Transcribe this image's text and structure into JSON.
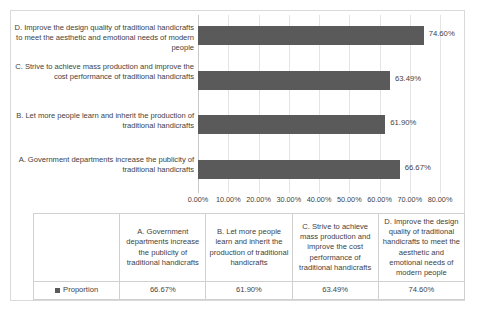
{
  "chart_data": {
    "type": "bar",
    "orientation": "horizontal",
    "title": "",
    "xlabel": "",
    "ylabel": "",
    "xlim": [
      0,
      80
    ],
    "grid": true,
    "legend_position": "table-left",
    "series_name": "Proportion",
    "series_color": "#5a5a5a",
    "categories": [
      "A. Government departments increase the publicity of traditional handicrafts",
      "B. Let more people learn and inherit the production of traditional handicrafts",
      "C. Strive to achieve mass production and improve the cost performance of traditional handicrafts",
      "D. Improve the design quality of traditional handicrafts to meet the aesthetic and emotional needs of modern people"
    ],
    "values": [
      66.67,
      61.9,
      63.49,
      74.6
    ],
    "value_labels": [
      "66.67%",
      "61.90%",
      "63.49%",
      "74.60%"
    ],
    "xticks": [
      0,
      10,
      20,
      30,
      40,
      50,
      60,
      70,
      80
    ],
    "xtick_labels": [
      "0.00%",
      "10.00%",
      "20.00%",
      "30.00%",
      "40.00%",
      "50.00%",
      "60.00%",
      "70.00%",
      "80.00%"
    ]
  },
  "plot": {
    "bars_top_to_bottom": [
      {
        "key": "D",
        "category_label": "D. Improve the design quality of traditional handicrafts to meet the aesthetic and emotional needs of modern people",
        "value": 74.6,
        "value_label": "74.60%"
      },
      {
        "key": "C",
        "category_label": "C. Strive to achieve mass production and improve the cost performance of traditional handicrafts",
        "value": 63.49,
        "value_label": "63.49%"
      },
      {
        "key": "B",
        "category_label": "B. Let more people learn and inherit the production of traditional handicrafts",
        "value": 61.9,
        "value_label": "61.90%"
      },
      {
        "key": "A",
        "category_label": "A. Government departments increase the publicity of traditional handicrafts",
        "value": 66.67,
        "value_label": "66.67%"
      }
    ]
  },
  "table": {
    "legend_label": "Proportion",
    "headers": [
      "A. Government departments increase the publicity of traditional handicrafts",
      "B. Let more people learn and inherit the production of traditional handicrafts",
      "C. Strive to achieve mass production and improve the cost performance of traditional handicrafts",
      "D. Improve the design quality of traditional handicrafts to meet the aesthetic and emotional needs of modern people"
    ],
    "values": [
      "66.67%",
      "61.90%",
      "63.49%",
      "74.60%"
    ]
  },
  "colors": {
    "bar": "#5a5a5a",
    "gridline": "#e4e4e4",
    "text": "#3f3f3f",
    "border": "#d9d9d9",
    "table_border": "#d0d0d0"
  }
}
